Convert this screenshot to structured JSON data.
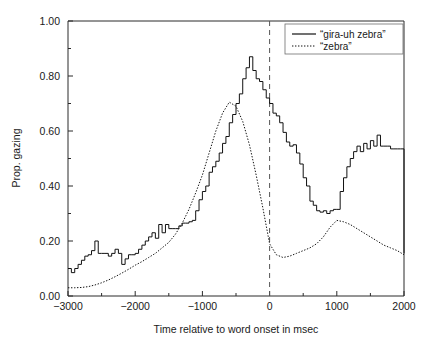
{
  "chart_data": {
    "type": "line",
    "title": "",
    "xlabel": "Time relative to word onset in msec",
    "ylabel": "Prop. gazing",
    "xlim": [
      -3000,
      2000
    ],
    "ylim": [
      0.0,
      1.0
    ],
    "xticks": [
      -3000,
      -2000,
      -1000,
      0,
      1000,
      2000
    ],
    "xticklabels": [
      "−3000",
      "−2000",
      "−1000",
      "0",
      "1000",
      "2000"
    ],
    "yticks": [
      0.0,
      0.2,
      0.4,
      0.6,
      0.8,
      1.0
    ],
    "yticklabels": [
      "0.00",
      "0.20",
      "0.40",
      "0.60",
      "0.80",
      "1.00"
    ],
    "x_minor_tick_interval": 500,
    "y_minor_tick_interval": 0.1,
    "grid": false,
    "legend_position": "top-right",
    "annotations": [
      {
        "name": "word-onset-marker",
        "type": "vline",
        "x": 0,
        "style": "dashed",
        "label": ""
      }
    ],
    "series": [
      {
        "name": "“gira-uh zebra”",
        "style": "solid",
        "color": "#111111",
        "x": [
          -3000,
          -2950,
          -2900,
          -2850,
          -2800,
          -2750,
          -2700,
          -2650,
          -2600,
          -2550,
          -2500,
          -2450,
          -2400,
          -2350,
          -2300,
          -2250,
          -2200,
          -2150,
          -2100,
          -2050,
          -2000,
          -1950,
          -1900,
          -1850,
          -1800,
          -1750,
          -1700,
          -1650,
          -1600,
          -1550,
          -1500,
          -1450,
          -1400,
          -1350,
          -1300,
          -1250,
          -1200,
          -1150,
          -1100,
          -1050,
          -1000,
          -950,
          -900,
          -850,
          -800,
          -750,
          -700,
          -650,
          -600,
          -550,
          -500,
          -450,
          -400,
          -350,
          -300,
          -250,
          -200,
          -150,
          -100,
          -50,
          0,
          50,
          100,
          150,
          200,
          250,
          300,
          350,
          400,
          450,
          500,
          550,
          600,
          650,
          700,
          750,
          800,
          850,
          900,
          950,
          1000,
          1050,
          1100,
          1150,
          1200,
          1250,
          1300,
          1350,
          1400,
          1450,
          1500,
          1550,
          1600,
          1650,
          1700,
          1750,
          1800,
          1850,
          1900,
          1950,
          2000
        ],
        "y": [
          0.1,
          0.085,
          0.1,
          0.115,
          0.13,
          0.145,
          0.15,
          0.165,
          0.2,
          0.155,
          0.155,
          0.155,
          0.145,
          0.155,
          0.17,
          0.155,
          0.115,
          0.135,
          0.15,
          0.15,
          0.155,
          0.17,
          0.185,
          0.2,
          0.215,
          0.23,
          0.21,
          0.26,
          0.23,
          0.26,
          0.245,
          0.245,
          0.245,
          0.255,
          0.265,
          0.265,
          0.27,
          0.275,
          0.31,
          0.35,
          0.38,
          0.4,
          0.45,
          0.47,
          0.49,
          0.52,
          0.555,
          0.58,
          0.63,
          0.66,
          0.7,
          0.735,
          0.79,
          0.83,
          0.87,
          0.82,
          0.79,
          0.78,
          0.75,
          0.72,
          0.7,
          0.665,
          0.655,
          0.63,
          0.595,
          0.56,
          0.545,
          0.55,
          0.52,
          0.48,
          0.43,
          0.4,
          0.345,
          0.33,
          0.31,
          0.305,
          0.31,
          0.3,
          0.31,
          0.315,
          0.315,
          0.38,
          0.43,
          0.47,
          0.5,
          0.525,
          0.545,
          0.525,
          0.555,
          0.535,
          0.565,
          0.545,
          0.585,
          0.545,
          0.545,
          0.545,
          0.535,
          0.535,
          0.535,
          0.535,
          0.155
        ]
      },
      {
        "name": "“zebra”",
        "style": "dotted",
        "color": "#111111",
        "x": [
          -3000,
          -2900,
          -2800,
          -2700,
          -2600,
          -2500,
          -2400,
          -2300,
          -2200,
          -2100,
          -2000,
          -1900,
          -1800,
          -1700,
          -1600,
          -1500,
          -1400,
          -1300,
          -1200,
          -1100,
          -1000,
          -900,
          -800,
          -700,
          -600,
          -500,
          -400,
          -300,
          -200,
          -100,
          0,
          100,
          200,
          300,
          400,
          500,
          600,
          700,
          800,
          900,
          1000,
          1100,
          1200,
          1300,
          1400,
          1500,
          1600,
          1700,
          1800,
          1900,
          2000
        ],
        "y": [
          0.03,
          0.03,
          0.031,
          0.034,
          0.04,
          0.048,
          0.058,
          0.07,
          0.083,
          0.097,
          0.112,
          0.125,
          0.14,
          0.155,
          0.175,
          0.195,
          0.225,
          0.265,
          0.315,
          0.375,
          0.44,
          0.52,
          0.6,
          0.665,
          0.705,
          0.69,
          0.635,
          0.55,
          0.44,
          0.32,
          0.19,
          0.15,
          0.14,
          0.145,
          0.155,
          0.165,
          0.175,
          0.19,
          0.215,
          0.25,
          0.275,
          0.27,
          0.26,
          0.245,
          0.23,
          0.215,
          0.2,
          0.185,
          0.175,
          0.165,
          0.15
        ]
      }
    ]
  },
  "legend": {
    "entries": [
      {
        "label": "“gira-uh zebra”",
        "style": "solid"
      },
      {
        "label": "“zebra”",
        "style": "dotted"
      }
    ]
  },
  "axes": {
    "x_title": "Time relative to word onset in msec",
    "y_title": "Prop. gazing"
  }
}
